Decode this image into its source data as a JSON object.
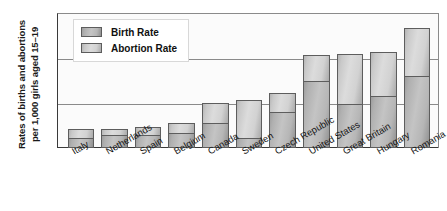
{
  "chart_data": {
    "type": "bar",
    "subtype": "stacked-vertical",
    "title": "",
    "xlabel": "",
    "ylabel": "Rates of births and abortions\nper 1,000 girls aged 15–19",
    "ylim": [
      0,
      90
    ],
    "yticks": [
      0,
      30,
      60,
      90
    ],
    "grid": true,
    "legend_position": "top-left",
    "categories": [
      "Italy",
      "Netherlands",
      "Spain",
      "Belgium",
      "Canada",
      "Sweden",
      "Czech Republic",
      "United States",
      "Great Britain",
      "Hungary",
      "Romania"
    ],
    "series": [
      {
        "name": "Birth Rate",
        "stack_position": "bottom",
        "color": "#b6b6b6",
        "values": [
          6.5,
          8.5,
          8.5,
          10,
          16.5,
          7,
          24,
          45,
          29.5,
          34.5,
          48
        ]
      },
      {
        "name": "Abortion Rate",
        "stack_position": "top",
        "color": "#d6d6d6",
        "values": [
          6.5,
          4.5,
          5.5,
          6.5,
          13.5,
          25,
          12.5,
          17,
          33,
          29.5,
          32
        ]
      }
    ],
    "totals": [
      13,
      13,
      14,
      16.5,
      30,
      32,
      36.5,
      62,
      62.5,
      64,
      80
    ]
  },
  "legend": {
    "items": [
      {
        "label": "Birth Rate",
        "swatch": "birth-rate-swatch"
      },
      {
        "label": "Abortion Rate",
        "swatch": "abortion-rate-swatch"
      }
    ]
  },
  "axis": {
    "y_title": "Rates of births and abortions\nper 1,000 girls aged 15–19",
    "y_ticks": [
      "90",
      "60",
      "30",
      "0"
    ]
  }
}
